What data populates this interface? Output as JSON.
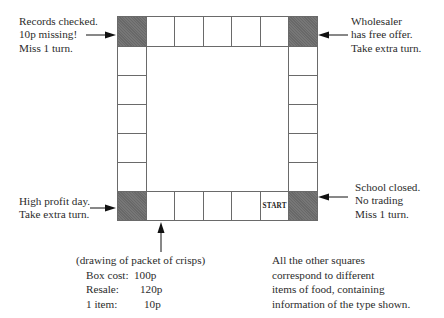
{
  "board": {
    "columns": 7,
    "rows": 7,
    "start_label": "START",
    "corner_color": "#6e6e6e",
    "line_color": "#6a6a6a"
  },
  "annotations": {
    "top_left": [
      "Records checked.",
      "10p missing!",
      "Miss 1 turn."
    ],
    "top_right": [
      "Wholesaler",
      "has free offer.",
      "Take extra turn."
    ],
    "bottom_left": [
      "High profit day.",
      "Take extra turn."
    ],
    "bottom_right": [
      "School closed.",
      "No trading",
      "Miss 1 turn."
    ]
  },
  "example_square": {
    "title": "(drawing of packet of crisps)",
    "rows": [
      {
        "label": "Box cost:",
        "value": "100p"
      },
      {
        "label": "Resale:",
        "value": "120p"
      },
      {
        "label": "1 item:",
        "value": "10p"
      }
    ]
  },
  "footnote": [
    "All the other squares",
    "correspond to different",
    "items of food, containing",
    "information of the type shown."
  ]
}
